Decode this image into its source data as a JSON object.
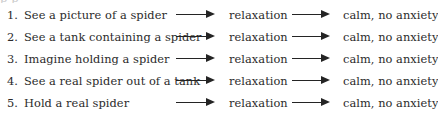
{
  "figure": {
    "clipped_text_above": "p        p",
    "middle_stage_label": "relaxation",
    "outcome_label": "calm, no anxiety",
    "arrow_icon_name": "right-arrow",
    "text_color": "#2b2b2b",
    "arrow_color": "#242424",
    "background_color": "#ffffff",
    "rows": [
      {
        "index": "1.",
        "situation": "See a picture of a spider",
        "middle": "relaxation",
        "outcome": "calm, no anxiety"
      },
      {
        "index": "2.",
        "situation": "See a tank containing a spider",
        "middle": "relaxation",
        "outcome": "calm, no anxiety"
      },
      {
        "index": "3.",
        "situation": "Imagine holding a spider",
        "middle": "relaxation",
        "outcome": "calm, no anxiety"
      },
      {
        "index": "4.",
        "situation": "See a real spider out of a tank",
        "middle": "relaxation",
        "outcome": "calm, no anxiety"
      },
      {
        "index": "5.",
        "situation": "Hold a real spider",
        "middle": "relaxation",
        "outcome": "calm, no anxiety"
      }
    ]
  }
}
